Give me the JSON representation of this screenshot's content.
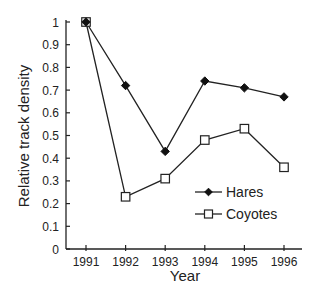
{
  "chart_data": {
    "type": "line",
    "title": "",
    "xlabel": "Year",
    "ylabel": "Relative track density",
    "x": [
      1991,
      1992,
      1993,
      1994,
      1995,
      1996
    ],
    "x_tick_labels": [
      "1991",
      "1992",
      "1993",
      "1994",
      "1995",
      "1996"
    ],
    "y_ticks": [
      0,
      0.1,
      0.2,
      0.3,
      0.4,
      0.5,
      0.6,
      0.7,
      0.8,
      0.9,
      1
    ],
    "y_tick_labels": [
      "0",
      "0.1",
      "0.2",
      "0.3",
      "0.4",
      "0.5",
      "0.6",
      "0.7",
      "0.8",
      "0.9",
      "1"
    ],
    "ylim": [
      0,
      1
    ],
    "xlim": [
      1990.5,
      1996.5
    ],
    "grid": false,
    "legend_position": "bottom-right",
    "series": [
      {
        "name": "Hares",
        "marker": "filled-diamond",
        "values": [
          1.0,
          0.72,
          0.43,
          0.74,
          0.71,
          0.67
        ]
      },
      {
        "name": "Coyotes",
        "marker": "open-square",
        "values": [
          1.0,
          0.23,
          0.31,
          0.48,
          0.53,
          0.36
        ]
      }
    ]
  }
}
